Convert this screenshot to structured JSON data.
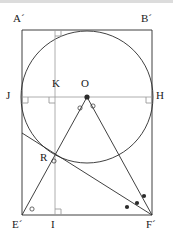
{
  "figure": {
    "type": "geometry-diagram",
    "width": 173,
    "height": 243,
    "stroke_color": "#2b2b2b",
    "light_stroke_color": "#9a9a9a",
    "background": "#ffffff",
    "label_color": "#1a1a1a"
  },
  "labels": {
    "a_prime": "A´",
    "b_prime": "B´",
    "j": "J",
    "k": "K",
    "o": "O",
    "h": "H",
    "r": "R",
    "e_prime": "E´",
    "i": "I",
    "f_prime": "F´"
  },
  "points": {
    "A": {
      "x": 22,
      "y": 30
    },
    "B": {
      "x": 152,
      "y": 30
    },
    "E": {
      "x": 22,
      "y": 215
    },
    "F": {
      "x": 152,
      "y": 215
    },
    "J": {
      "x": 22,
      "y": 97
    },
    "H": {
      "x": 152,
      "y": 97
    },
    "O": {
      "x": 87,
      "y": 97
    },
    "K": {
      "x": 55,
      "y": 97
    },
    "I": {
      "x": 55,
      "y": 215
    },
    "R": {
      "x": 50,
      "y": 158
    },
    "T_top": {
      "x": 55,
      "y": 30
    },
    "L_left": {
      "x": 22,
      "y": 133
    }
  },
  "circle": {
    "center_x": 87,
    "center_y": 97,
    "radius": 66
  },
  "segments": [
    {
      "name": "rect-top-AB",
      "from": "A",
      "to": "B"
    },
    {
      "name": "rect-left-AE",
      "from": "A",
      "to": "E"
    },
    {
      "name": "rect-right-BF",
      "from": "B",
      "to": "F"
    },
    {
      "name": "rect-bottom-EF",
      "from": "E",
      "to": "F"
    },
    {
      "name": "diameter-JH",
      "from": "J",
      "to": "H"
    },
    {
      "name": "vertical-K-I",
      "from": "T_top",
      "to": "I"
    },
    {
      "name": "O-to-E",
      "from": "O",
      "to": "E"
    },
    {
      "name": "O-to-F",
      "from": "O",
      "to": "F"
    },
    {
      "name": "L-to-F",
      "from": "L_left",
      "to": "F"
    }
  ],
  "angle_marks": {
    "right_angles": [
      {
        "name": "right-angle-at-top-K",
        "x": 55,
        "y": 30,
        "dx": 1,
        "dy": 1
      },
      {
        "name": "right-angle-at-J",
        "x": 22,
        "y": 97,
        "dx": 1,
        "dy": 1
      },
      {
        "name": "right-angle-at-K",
        "x": 55,
        "y": 97,
        "dx": -1,
        "dy": 1
      },
      {
        "name": "right-angle-at-H",
        "x": 152,
        "y": 97,
        "dx": -1,
        "dy": 1
      },
      {
        "name": "right-angle-at-I",
        "x": 55,
        "y": 215,
        "dx": 1,
        "dy": -1
      }
    ],
    "open_circles": [
      {
        "name": "angle-mark-o-left",
        "x": 80,
        "y": 108
      },
      {
        "name": "angle-mark-o-right",
        "x": 93,
        "y": 106
      },
      {
        "name": "angle-mark-r",
        "x": 54,
        "y": 161
      },
      {
        "name": "angle-mark-e",
        "x": 32,
        "y": 209
      }
    ],
    "filled_dots": [
      {
        "name": "angle-dot-f-upper",
        "x": 144,
        "y": 196
      },
      {
        "name": "angle-dot-f-middle",
        "x": 137,
        "y": 203
      },
      {
        "name": "angle-dot-f-lower",
        "x": 127,
        "y": 207
      }
    ],
    "vertex_dot": {
      "name": "vertex-dot-o",
      "x": 87,
      "y": 97
    }
  },
  "label_positions": {
    "a_prime": {
      "x": 13,
      "y": 13
    },
    "b_prime": {
      "x": 141,
      "y": 13
    },
    "j": {
      "x": 6,
      "y": 90
    },
    "k": {
      "x": 52,
      "y": 78
    },
    "o": {
      "x": 81,
      "y": 78
    },
    "h": {
      "x": 156,
      "y": 90
    },
    "r": {
      "x": 40,
      "y": 152
    },
    "e_prime": {
      "x": 12,
      "y": 219
    },
    "i": {
      "x": 51,
      "y": 219
    },
    "f_prime": {
      "x": 146,
      "y": 219
    }
  }
}
